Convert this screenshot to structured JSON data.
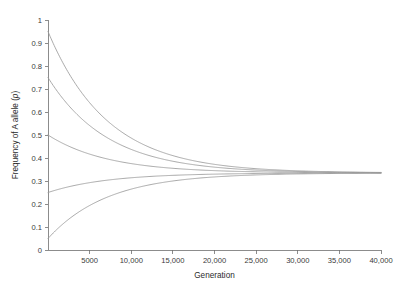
{
  "chart_data": {
    "type": "line",
    "title": "",
    "xlabel": "Generation",
    "ylabel": "Frequency of A allele (p)",
    "ylabel_parts": {
      "main": "Frequency of A allele (",
      "italic": "p",
      "close": ")"
    },
    "xlim": [
      0,
      40000
    ],
    "ylim": [
      0,
      1
    ],
    "grid": false,
    "legend": "none",
    "line_color": "#9b9b9b",
    "axis_color": "#6f6f6f",
    "background": "#ffffff",
    "equilibrium_value": 0.335,
    "decay_rate_per_generation": 0.00014,
    "xticks": [
      {
        "value": 5000,
        "label": "5000"
      },
      {
        "value": 10000,
        "label": "10,000"
      },
      {
        "value": 15000,
        "label": "15,000"
      },
      {
        "value": 20000,
        "label": "20,000"
      },
      {
        "value": 25000,
        "label": "25,000"
      },
      {
        "value": 30000,
        "label": "30,000"
      },
      {
        "value": 35000,
        "label": "35,000"
      },
      {
        "value": 40000,
        "label": "40,000"
      }
    ],
    "yticks": [
      {
        "value": 0,
        "label": "0"
      },
      {
        "value": 0.1,
        "label": "0.1"
      },
      {
        "value": 0.2,
        "label": "0.2"
      },
      {
        "value": 0.3,
        "label": "0.3"
      },
      {
        "value": 0.4,
        "label": "0.4"
      },
      {
        "value": 0.5,
        "label": "0.5"
      },
      {
        "value": 0.6,
        "label": "0.6"
      },
      {
        "value": 0.7,
        "label": "0.7"
      },
      {
        "value": 0.8,
        "label": "0.8"
      },
      {
        "value": 0.9,
        "label": "0.9"
      },
      {
        "value": 1,
        "label": "1"
      }
    ],
    "series": [
      {
        "name": "p0 = 0.95",
        "p0": 0.95,
        "x": [
          0,
          1000,
          2000,
          3000,
          4000,
          5000,
          6000,
          7000,
          8000,
          9000,
          10000,
          12000,
          14000,
          16000,
          18000,
          20000,
          24000,
          28000,
          32000,
          36000,
          40000
        ],
        "values": [
          0.95,
          0.87,
          0.8,
          0.74,
          0.687,
          0.641,
          0.601,
          0.566,
          0.536,
          0.509,
          0.486,
          0.448,
          0.419,
          0.397,
          0.381,
          0.368,
          0.352,
          0.344,
          0.34,
          0.337,
          0.336
        ]
      },
      {
        "name": "p0 = 0.75",
        "p0": 0.75,
        "x": [
          0,
          1000,
          2000,
          3000,
          4000,
          5000,
          6000,
          7000,
          8000,
          9000,
          10000,
          12000,
          14000,
          16000,
          18000,
          20000,
          24000,
          28000,
          32000,
          36000,
          40000
        ],
        "values": [
          0.75,
          0.696,
          0.649,
          0.608,
          0.573,
          0.542,
          0.515,
          0.491,
          0.471,
          0.453,
          0.437,
          0.411,
          0.392,
          0.377,
          0.366,
          0.357,
          0.346,
          0.341,
          0.338,
          0.336,
          0.336
        ]
      },
      {
        "name": "p0 = 0.50",
        "p0": 0.5,
        "x": [
          0,
          1000,
          2000,
          3000,
          4000,
          5000,
          6000,
          7000,
          8000,
          9000,
          10000,
          12000,
          14000,
          16000,
          18000,
          20000,
          24000,
          28000,
          32000,
          36000,
          40000
        ],
        "values": [
          0.5,
          0.479,
          0.461,
          0.445,
          0.431,
          0.419,
          0.408,
          0.399,
          0.391,
          0.384,
          0.378,
          0.367,
          0.359,
          0.354,
          0.349,
          0.346,
          0.341,
          0.338,
          0.337,
          0.336,
          0.335
        ]
      },
      {
        "name": "p0 = 0.25",
        "p0": 0.25,
        "x": [
          0,
          1000,
          2000,
          3000,
          4000,
          5000,
          6000,
          7000,
          8000,
          9000,
          10000,
          12000,
          14000,
          16000,
          18000,
          20000,
          24000,
          28000,
          32000,
          36000,
          40000
        ],
        "values": [
          0.25,
          0.261,
          0.271,
          0.279,
          0.287,
          0.293,
          0.299,
          0.304,
          0.308,
          0.312,
          0.315,
          0.321,
          0.325,
          0.328,
          0.33,
          0.331,
          0.333,
          0.334,
          0.335,
          0.335,
          0.335
        ]
      },
      {
        "name": "p0 = 0.05",
        "p0": 0.05,
        "x": [
          0,
          1000,
          2000,
          3000,
          4000,
          5000,
          6000,
          7000,
          8000,
          9000,
          10000,
          12000,
          14000,
          16000,
          18000,
          20000,
          24000,
          28000,
          32000,
          36000,
          40000
        ],
        "values": [
          0.05,
          0.087,
          0.119,
          0.148,
          0.173,
          0.196,
          0.216,
          0.233,
          0.249,
          0.262,
          0.274,
          0.293,
          0.307,
          0.317,
          0.323,
          0.328,
          0.332,
          0.334,
          0.335,
          0.335,
          0.335
        ]
      }
    ]
  }
}
